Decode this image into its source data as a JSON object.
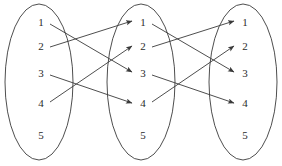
{
  "diagram": {
    "type": "mapping-diagram",
    "stroke_color": "#3a3a3a",
    "label_color": "#2b2b2b",
    "background": "#ffffff",
    "ellipse_rx": 34,
    "ellipse_ry": 78,
    "ellipse_cy": 82,
    "sets": [
      {
        "id": "set-left",
        "name": "left-set",
        "cx": 39,
        "label_x": 41,
        "elements": [
          {
            "label": "1",
            "y": 22
          },
          {
            "label": "2",
            "y": 46
          },
          {
            "label": "3",
            "y": 73
          },
          {
            "label": "4",
            "y": 103
          },
          {
            "label": "5",
            "y": 135
          }
        ]
      },
      {
        "id": "set-middle",
        "name": "middle-set",
        "cx": 141,
        "label_x": 143,
        "elements": [
          {
            "label": "1",
            "y": 22
          },
          {
            "label": "2",
            "y": 46
          },
          {
            "label": "3",
            "y": 73
          },
          {
            "label": "4",
            "y": 103
          },
          {
            "label": "5",
            "y": 135
          }
        ]
      },
      {
        "id": "set-right",
        "name": "right-set",
        "cx": 243,
        "label_x": 245,
        "elements": [
          {
            "label": "1",
            "y": 22
          },
          {
            "label": "2",
            "y": 46
          },
          {
            "label": "3",
            "y": 73
          },
          {
            "label": "4",
            "y": 103
          },
          {
            "label": "5",
            "y": 135
          }
        ]
      }
    ],
    "arrows": [
      {
        "name": "arrow-left1-to-middle3",
        "from_set": "set-left",
        "from": "1",
        "to_set": "set-middle",
        "to": "3",
        "x1": 50,
        "y1": 24,
        "x2": 132,
        "y2": 72
      },
      {
        "name": "arrow-left2-to-middle1",
        "from_set": "set-left",
        "from": "2",
        "to_set": "set-middle",
        "to": "1",
        "x1": 50,
        "y1": 47,
        "x2": 132,
        "y2": 21
      },
      {
        "name": "arrow-left3-to-middle4",
        "from_set": "set-left",
        "from": "3",
        "to_set": "set-middle",
        "to": "4",
        "x1": 50,
        "y1": 75,
        "x2": 132,
        "y2": 103
      },
      {
        "name": "arrow-left4-to-middle2",
        "from_set": "set-left",
        "from": "4",
        "to_set": "set-middle",
        "to": "2",
        "x1": 50,
        "y1": 102,
        "x2": 132,
        "y2": 46
      },
      {
        "name": "arrow-middle1-to-right3",
        "from_set": "set-middle",
        "from": "1",
        "to_set": "set-right",
        "to": "3",
        "x1": 152,
        "y1": 24,
        "x2": 234,
        "y2": 72
      },
      {
        "name": "arrow-middle2-to-right1",
        "from_set": "set-middle",
        "from": "2",
        "to_set": "set-right",
        "to": "1",
        "x1": 152,
        "y1": 47,
        "x2": 234,
        "y2": 21
      },
      {
        "name": "arrow-middle3-to-right4",
        "from_set": "set-middle",
        "from": "3",
        "to_set": "set-right",
        "to": "4",
        "x1": 152,
        "y1": 75,
        "x2": 234,
        "y2": 103
      },
      {
        "name": "arrow-middle4-to-right2",
        "from_set": "set-middle",
        "from": "4",
        "to_set": "set-right",
        "to": "2",
        "x1": 152,
        "y1": 102,
        "x2": 234,
        "y2": 46
      }
    ]
  }
}
